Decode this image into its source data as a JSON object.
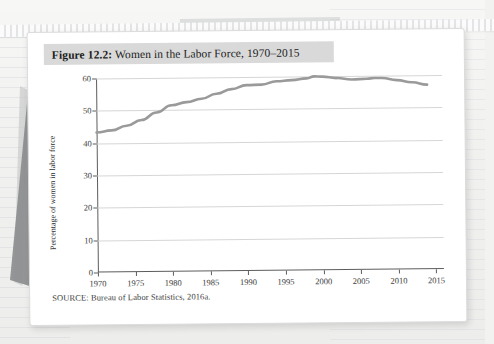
{
  "figure": {
    "label": "Figure 12.2:",
    "title": " Women in the Labor Force, 1970–2015",
    "source": "SOURCE: Bureau of Labor Statistics, 2016a."
  },
  "colors": {
    "line": "#9a9a9a",
    "grid": "#d6d6d6",
    "axis": "#5d5d5d",
    "title_band": "#d9d9d9",
    "card": "#ffffff",
    "page_bg": "#f2f2f1",
    "wedge": "#8c8d8f"
  },
  "chart_data": {
    "type": "line",
    "title": "Women in the Labor Force, 1970–2015",
    "xlabel": "",
    "ylabel": "Percentage of women in labor force",
    "xlim": [
      1970,
      2016
    ],
    "ylim": [
      0,
      60
    ],
    "xticks": [
      1970,
      1975,
      1980,
      1985,
      1990,
      1995,
      2000,
      2005,
      2010,
      2015
    ],
    "yticks": [
      0,
      10,
      20,
      30,
      40,
      50,
      60
    ],
    "grid": "horizontal",
    "legend": "none",
    "x": [
      1970,
      1972,
      1974,
      1976,
      1978,
      1980,
      1982,
      1984,
      1986,
      1988,
      1990,
      1992,
      1994,
      1996,
      1998,
      1999,
      2000,
      2002,
      2004,
      2006,
      2007,
      2008,
      2010,
      2012,
      2014
    ],
    "values": [
      43.3,
      43.9,
      45.3,
      47.0,
      49.3,
      51.5,
      52.4,
      53.4,
      54.9,
      56.3,
      57.5,
      57.6,
      58.6,
      58.9,
      59.4,
      60.0,
      59.9,
      59.4,
      58.9,
      59.1,
      59.3,
      59.3,
      58.6,
      57.9,
      57.1
    ]
  },
  "icons": {
    "binding": "spiral-binding",
    "wedge": "grey-wedge-object"
  }
}
